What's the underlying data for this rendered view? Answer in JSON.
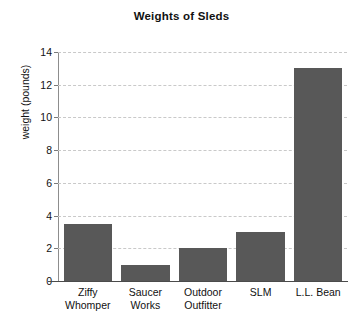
{
  "chart_data": {
    "type": "bar",
    "title": "Weights of Sleds",
    "xlabel": "",
    "ylabel": "weight (pounds)",
    "categories": [
      "Ziffy Whomper",
      "Saucer Works",
      "Outdoor Outfitter",
      "SLM",
      "L.L. Bean"
    ],
    "category_lines": [
      [
        "Ziffy",
        "Whomper"
      ],
      [
        "Saucer",
        "Works"
      ],
      [
        "Outdoor",
        "Outfitter"
      ],
      [
        "SLM"
      ],
      [
        "L.L. Bean"
      ]
    ],
    "values": [
      3.5,
      1,
      2,
      3,
      13
    ],
    "ylim": [
      0,
      14
    ],
    "yticks": [
      0,
      2,
      4,
      6,
      8,
      10,
      12,
      14
    ],
    "ytick_labels": [
      "0",
      "2",
      "4",
      "6",
      "8",
      "10",
      "12",
      "14"
    ],
    "grid": true,
    "grid_style": "dashed",
    "legend": null,
    "bar_color": "#585858",
    "grid_color": "#c9c9c9",
    "axis_color": "#4b4b4b",
    "background_color": "#ffffff",
    "text_color": "#111111"
  }
}
